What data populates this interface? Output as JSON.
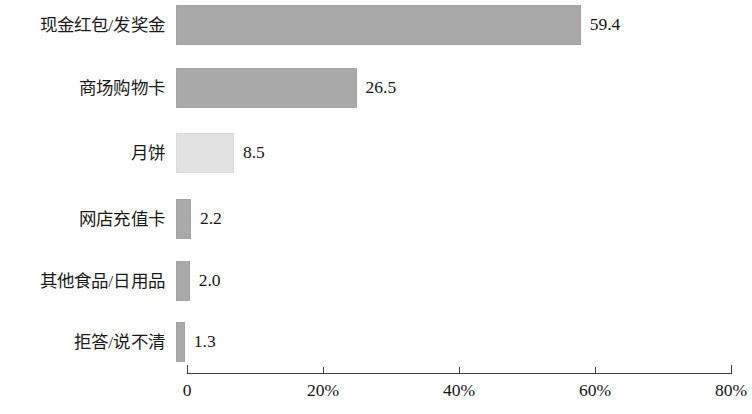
{
  "chart_data": {
    "type": "bar",
    "orientation": "horizontal",
    "title": "",
    "subtitle": "",
    "xlabel": "",
    "ylabel": "",
    "xlim": [
      0,
      80
    ],
    "grid": false,
    "legend": null,
    "value_suffix": "",
    "axis_unit": "%",
    "categories": [
      "现金红包/发奖金",
      "商场购物卡",
      "月饼",
      "网店充值卡",
      "其他食品/日用品",
      "拒答/说不清"
    ],
    "values": [
      59.4,
      26.5,
      8.5,
      2.2,
      2.0,
      1.3
    ],
    "value_labels": [
      "59.4",
      "26.5",
      "8.5",
      "2.2",
      "2.0",
      "1.3"
    ],
    "bar_colors": [
      "#a9a9a9",
      "#a9a9a9",
      "#e2e2e2",
      "#a9a9a9",
      "#a9a9a9",
      "#a9a9a9"
    ],
    "xticks": [
      0,
      20,
      40,
      60,
      80
    ],
    "xtick_labels": [
      "0",
      "20%",
      "40%",
      "60%",
      "80%"
    ]
  },
  "axis": {
    "tick_0": "0",
    "tick_20": "20%",
    "tick_40": "40%",
    "tick_60": "60%",
    "tick_80": "80%"
  },
  "rows": [
    {
      "label": "现金红包/发奖金",
      "value_label": "59.4"
    },
    {
      "label": "商场购物卡",
      "value_label": "26.5"
    },
    {
      "label": "月饼",
      "value_label": "8.5"
    },
    {
      "label": "网店充值卡",
      "value_label": "2.2"
    },
    {
      "label": "其他食品/日用品",
      "value_label": "2.0"
    },
    {
      "label": "拒答/说不清",
      "value_label": "1.3"
    }
  ]
}
